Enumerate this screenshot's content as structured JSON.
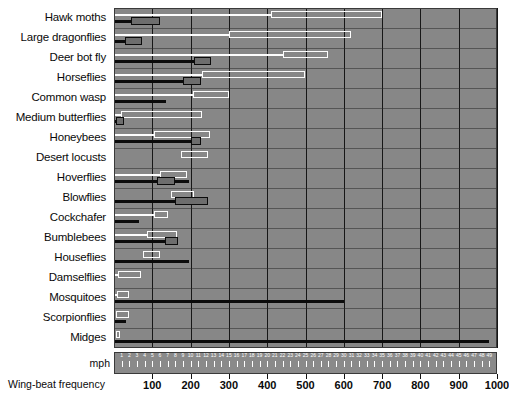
{
  "chart_data": {
    "type": "bar",
    "title": "",
    "orientation": "horizontal",
    "xlabel": "Wing-beat frequency",
    "ylabel": "",
    "grid": true,
    "legend_position": "none",
    "axes": [
      {
        "name": "wing_beat_frequency",
        "unit": "beats per second",
        "position": "bottom",
        "range": [
          0,
          1000
        ],
        "ticks": [
          100,
          200,
          300,
          400,
          500,
          600,
          700,
          800,
          900,
          1000
        ],
        "tick_labels": [
          "100",
          "200",
          "300",
          "400",
          "500",
          "600",
          "700",
          "800",
          "900",
          "1000"
        ],
        "series_style": "white open bar"
      },
      {
        "name": "speed",
        "unit": "mph",
        "position": "inner-bottom",
        "range": [
          0,
          50
        ],
        "ticks": [
          1,
          2,
          3,
          4,
          5,
          6,
          7,
          8,
          9,
          10,
          11,
          12,
          13,
          14,
          15,
          16,
          17,
          18,
          19,
          20,
          21,
          22,
          23,
          24,
          25,
          26,
          27,
          28,
          29,
          30,
          31,
          32,
          33,
          34,
          35,
          36,
          37,
          38,
          39,
          40,
          41,
          42,
          43,
          44,
          45,
          46,
          47,
          48,
          49
        ],
        "tick_labels": [
          "1",
          "2",
          "3",
          "4",
          "5",
          "6",
          "7",
          "8",
          "9",
          "10",
          "11",
          "12",
          "13",
          "14",
          "15",
          "16",
          "17",
          "18",
          "19",
          "20",
          "21",
          "22",
          "23",
          "24",
          "25",
          "26",
          "27",
          "28",
          "29",
          "30",
          "31",
          "32",
          "33",
          "34",
          "35",
          "36",
          "37",
          "38",
          "39",
          "40",
          "41",
          "42",
          "43",
          "44",
          "45",
          "46",
          "47",
          "48",
          "49"
        ],
        "axis_title": "mph",
        "series_style": "black filled bar"
      }
    ],
    "categories": [
      "Hawk moths",
      "Large dragonflies",
      "Deer bot fly",
      "Horseflies",
      "Common wasp",
      "Medium butterflies",
      "Honeybees",
      "Desert locusts",
      "Hoverflies",
      "Blowflies",
      "Cockchafer",
      "Bumblebees",
      "Houseflies",
      "Damselflies",
      "Mosquitoes",
      "Scorpionflies",
      "Midges"
    ],
    "series": [
      {
        "name": "Wing-beat frequency",
        "unit": "beats/second",
        "style": "white-open-bar",
        "color": "#fdfdfd",
        "ranges": [
          {
            "category": "Hawk moths",
            "stem_end": 410,
            "box_start": 410,
            "box_end": 700
          },
          {
            "category": "Large dragonflies",
            "stem_end": 300,
            "box_start": 300,
            "box_end": 620
          },
          {
            "category": "Deer bot fly",
            "stem_end": 440,
            "box_start": 440,
            "box_end": 560
          },
          {
            "category": "Horseflies",
            "stem_end": 230,
            "box_start": 230,
            "box_end": 500
          },
          {
            "category": "Common wasp",
            "stem_end": 205,
            "box_start": 205,
            "box_end": 300
          },
          {
            "category": "Medium butterflies",
            "stem_end": 18,
            "box_start": 18,
            "box_end": 230
          },
          {
            "category": "Honeybees",
            "stem_end": 105,
            "box_start": 105,
            "box_end": 250
          },
          {
            "category": "Desert locusts",
            "stem_end": 0,
            "box_start": 175,
            "box_end": 245
          },
          {
            "category": "Hoverflies",
            "stem_end": 120,
            "box_start": 120,
            "box_end": 190
          },
          {
            "category": "Blowflies",
            "stem_end": 0,
            "box_start": 150,
            "box_end": 210
          },
          {
            "category": "Cockchafer",
            "stem_end": 105,
            "box_start": 105,
            "box_end": 140
          },
          {
            "category": "Bumblebees",
            "stem_end": 85,
            "box_start": 85,
            "box_end": 165
          },
          {
            "category": "Houseflies",
            "stem_end": 0,
            "box_start": 75,
            "box_end": 120
          },
          {
            "category": "Damselflies",
            "stem_end": 10,
            "box_start": 10,
            "box_end": 70
          },
          {
            "category": "Mosquitoes",
            "stem_end": 8,
            "box_start": 8,
            "box_end": 40
          },
          {
            "category": "Scorpionflies",
            "stem_end": 0,
            "box_start": 6,
            "box_end": 38
          },
          {
            "category": "Midges",
            "stem_end": 0,
            "box_start": 4,
            "box_end": 16
          }
        ]
      },
      {
        "name": "Speed",
        "unit": "mph",
        "style": "black-filled-bar",
        "color": "#0b0b0b",
        "box_fill": "#6d6d6d",
        "ranges": [
          {
            "category": "Hawk moths",
            "stem_end": 2.2,
            "box_start": 2.2,
            "box_end": 6.0
          },
          {
            "category": "Large dragonflies",
            "stem_end": 1.5,
            "box_start": 1.5,
            "box_end": 3.6
          },
          {
            "category": "Deer bot fly",
            "stem_end": 10.4,
            "box_start": 10.4,
            "box_end": 12.6
          },
          {
            "category": "Horseflies",
            "stem_end": 9.0,
            "box_start": 9.0,
            "box_end": 11.4
          },
          {
            "category": "Common wasp",
            "stem_end": 6.8,
            "box_start": 6.8,
            "box_end": 6.8
          },
          {
            "category": "Medium butterflies",
            "stem_end": 0.0,
            "box_start": 0.3,
            "box_end": 1.3
          },
          {
            "category": "Honeybees",
            "stem_end": 10.0,
            "box_start": 10.0,
            "box_end": 11.3
          },
          {
            "category": "Desert locusts",
            "stem_end": 0.0,
            "box_start": 0.0,
            "box_end": 0.0
          },
          {
            "category": "Hoverflies",
            "stem_end": 9.8,
            "box_start": 5.6,
            "box_end": 7.9
          },
          {
            "category": "Blowflies",
            "stem_end": 12.3,
            "box_start": 8.0,
            "box_end": 12.3
          },
          {
            "category": "Cockchafer",
            "stem_end": 3.3,
            "box_start": 3.3,
            "box_end": 3.3
          },
          {
            "category": "Bumblebees",
            "stem_end": 8.4,
            "box_start": 6.6,
            "box_end": 8.4
          },
          {
            "category": "Houseflies",
            "stem_end": 9.8,
            "box_start": 9.8,
            "box_end": 9.8
          },
          {
            "category": "Damselflies",
            "stem_end": 0.0,
            "box_start": 0.0,
            "box_end": 0.0
          },
          {
            "category": "Mosquitoes",
            "stem_end": 30.0,
            "box_start": 30.0,
            "box_end": 30.0
          },
          {
            "category": "Scorpionflies",
            "stem_end": 1.6,
            "box_start": 1.6,
            "box_end": 1.6
          },
          {
            "category": "Midges",
            "stem_end": 49.0,
            "box_start": 49.0,
            "box_end": 49.0
          }
        ]
      }
    ]
  },
  "colors": {
    "plot_background": "#878787",
    "page_background": "#ffffff",
    "gridline": "#171717",
    "white_bar": "#fdfdfd",
    "black_bar": "#0b0b0b",
    "gray_box_fill": "#6d6d6d",
    "mph_strip": "#8a8a8a"
  }
}
